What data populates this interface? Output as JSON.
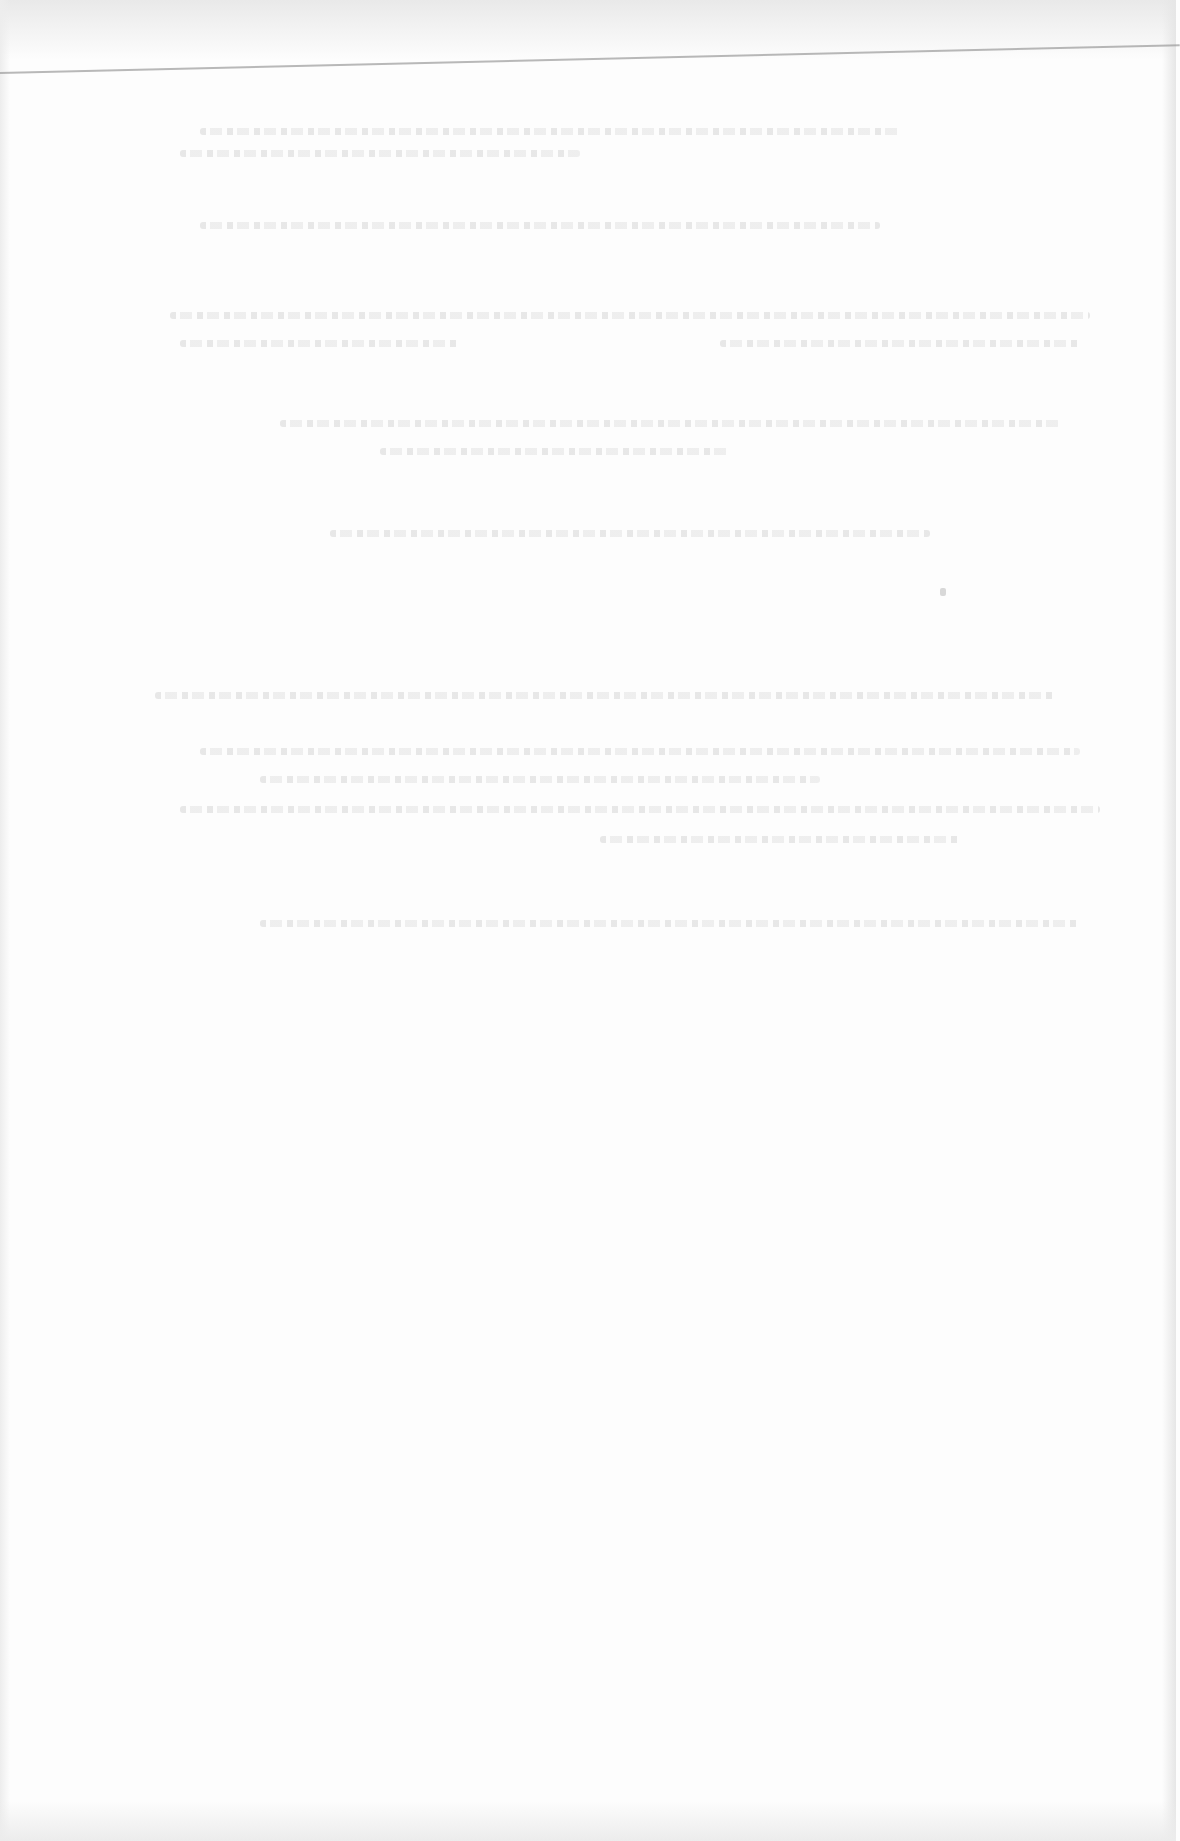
{
  "document": {
    "type": "scanned page",
    "legibility": "text too faded to read",
    "header_rule": true,
    "text_blocks": [
      {
        "id": "block-1",
        "lines": 2,
        "content": ""
      },
      {
        "id": "block-2",
        "lines": 1,
        "content": ""
      },
      {
        "id": "block-3",
        "lines": 2,
        "content": ""
      },
      {
        "id": "block-4",
        "lines": 2,
        "content": ""
      },
      {
        "id": "block-5",
        "lines": 1,
        "content": ""
      },
      {
        "id": "block-6",
        "lines": 5,
        "content": ""
      },
      {
        "id": "block-7",
        "lines": 1,
        "content": ""
      }
    ],
    "footnote_marker": ""
  }
}
